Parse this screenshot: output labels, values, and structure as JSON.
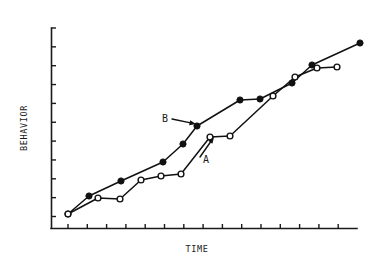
{
  "figure": {
    "background_color": "#ffffff",
    "ink_color": "#111111"
  },
  "chart_data": {
    "type": "line",
    "title": "",
    "subtitle": "",
    "xlabel": "TIME",
    "ylabel": "BEHAVIOR",
    "xlim": [
      0,
      16
    ],
    "ylim": [
      0,
      10
    ],
    "grid": false,
    "legend": "none",
    "x_tick_labels": [],
    "y_tick_labels": [],
    "x_tick_count": 16,
    "y_tick_count": 11,
    "annotations": [
      {
        "label": "B",
        "describes_series": "B",
        "label_x": 162,
        "label_y": 122,
        "arrow_from_x": 172,
        "arrow_from_y": 119,
        "arrow_to_x": 196,
        "arrow_to_y": 124
      },
      {
        "label": "A",
        "describes_series": "A",
        "label_x": 203,
        "label_y": 163,
        "arrow_from_x": 200,
        "arrow_from_y": 157,
        "arrow_to_x": 214,
        "arrow_to_y": 137
      }
    ],
    "series": [
      {
        "name": "A",
        "marker": "open-circle",
        "values": [
          {
            "x": 0.85,
            "y": 0.72
          },
          {
            "x": 2.35,
            "y": 1.62
          },
          {
            "x": 3.45,
            "y": 1.55
          },
          {
            "x": 4.5,
            "y": 2.48
          },
          {
            "x": 5.5,
            "y": 2.72
          },
          {
            "x": 6.5,
            "y": 2.8
          },
          {
            "x": 8.0,
            "y": 4.52
          },
          {
            "x": 9.0,
            "y": 4.6
          },
          {
            "x": 11.2,
            "y": 6.5
          },
          {
            "x": 12.3,
            "y": 7.4
          },
          {
            "x": 13.4,
            "y": 7.9
          },
          {
            "x": 14.4,
            "y": 7.92
          }
        ],
        "pixel_points": [
          [
            68,
            214
          ],
          [
            98,
            198
          ],
          [
            120,
            199
          ],
          [
            141,
            180
          ],
          [
            161,
            176
          ],
          [
            181,
            174
          ],
          [
            210,
            137
          ],
          [
            230,
            136
          ],
          [
            273,
            96
          ],
          [
            295,
            77
          ],
          [
            317,
            68
          ],
          [
            337,
            67
          ]
        ]
      },
      {
        "name": "B",
        "marker": "filled-circle",
        "values": [
          {
            "x": 0.85,
            "y": 0.72
          },
          {
            "x": 1.9,
            "y": 1.68
          },
          {
            "x": 3.5,
            "y": 2.42
          },
          {
            "x": 5.6,
            "y": 3.32
          },
          {
            "x": 6.6,
            "y": 4.28
          },
          {
            "x": 7.3,
            "y": 5.18
          },
          {
            "x": 9.4,
            "y": 6.48
          },
          {
            "x": 10.4,
            "y": 6.55
          },
          {
            "x": 12.0,
            "y": 7.4
          },
          {
            "x": 13.0,
            "y": 8.3
          },
          {
            "x": 15.4,
            "y": 9.35
          }
        ],
        "pixel_points": [
          [
            68,
            214
          ],
          [
            89,
            196
          ],
          [
            121,
            181
          ],
          [
            163,
            162
          ],
          [
            183,
            144
          ],
          [
            197,
            126
          ],
          [
            240,
            100
          ],
          [
            260,
            99
          ],
          [
            292,
            83
          ],
          [
            312,
            65
          ],
          [
            360,
            43
          ]
        ]
      }
    ]
  }
}
